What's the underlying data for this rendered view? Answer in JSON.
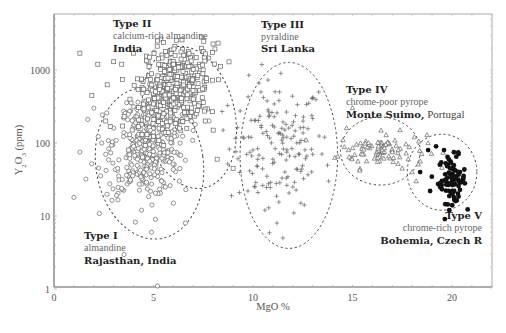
{
  "chart_data": {
    "type": "scatter",
    "title": "",
    "xlabel": "MgO %",
    "ylabel": "Y2O3 (ppm)",
    "ylabel_parts": {
      "base": "Y",
      "sub1": "2",
      "mid": "O",
      "sub2": "3",
      "rest": " (ppm)"
    },
    "xlim": [
      0,
      22
    ],
    "ylim": [
      1,
      5800
    ],
    "yscale": "log",
    "grid": false,
    "x_ticks": [
      0,
      5,
      10,
      15,
      20
    ],
    "x_tick_labels": [
      "0",
      "5",
      "10",
      "15",
      "20"
    ],
    "y_ticks": [
      1,
      10,
      100,
      1000
    ],
    "y_tick_labels": [
      "1",
      "10",
      "100",
      "1000"
    ],
    "series": [
      {
        "name": "Type I",
        "marker": "circle-open",
        "mineral": "almandine",
        "location": "Rajasthan, India",
        "cluster": {
          "x_center": 4.8,
          "x_spread": 0.9,
          "logy_center": 2.0,
          "logy_spread": 0.38,
          "count": 420
        },
        "points": [
          [
            1.0,
            18
          ],
          [
            1.3,
            75
          ],
          [
            1.6,
            32
          ],
          [
            1.7,
            210
          ],
          [
            1.9,
            52
          ],
          [
            2.0,
            300
          ],
          [
            2.4,
            100
          ],
          [
            2.6,
            70
          ],
          [
            3.0,
            160
          ],
          [
            3.2,
            45
          ],
          [
            3.5,
            220
          ],
          [
            3.8,
            130
          ],
          [
            4.0,
            90
          ],
          [
            4.2,
            60
          ],
          [
            4.4,
            180
          ],
          [
            4.6,
            110
          ],
          [
            4.8,
            70
          ],
          [
            5.0,
            140
          ],
          [
            5.2,
            40
          ],
          [
            5.4,
            95
          ],
          [
            5.6,
            25
          ],
          [
            5.8,
            55
          ],
          [
            6.0,
            15
          ],
          [
            6.3,
            30
          ],
          [
            6.6,
            8
          ],
          [
            5.2,
            1.1
          ],
          [
            4.9,
            6
          ],
          [
            5.1,
            9
          ]
        ]
      },
      {
        "name": "Type II",
        "marker": "square-open",
        "mineral": "calcium-rich almandine",
        "location": "India",
        "cluster": {
          "x_center": 6.0,
          "x_spread": 0.9,
          "logy_center": 2.75,
          "logy_spread": 0.3,
          "count": 380
        },
        "points": [
          [
            1.3,
            1700
          ],
          [
            1.9,
            450
          ],
          [
            2.2,
            1200
          ],
          [
            2.6,
            200
          ],
          [
            3.0,
            1300
          ],
          [
            3.4,
            1200
          ],
          [
            4.0,
            1700
          ],
          [
            4.8,
            1500
          ],
          [
            5.2,
            2500
          ],
          [
            5.6,
            1800
          ],
          [
            6.0,
            1200
          ],
          [
            6.4,
            800
          ],
          [
            6.8,
            600
          ],
          [
            7.0,
            400
          ],
          [
            7.2,
            280
          ],
          [
            7.6,
            200
          ],
          [
            8.0,
            150
          ],
          [
            8.2,
            60
          ],
          [
            9.0,
            45
          ]
        ]
      },
      {
        "name": "Type III",
        "marker": "plus",
        "mineral": "pyraldine",
        "location": "Sri Lanka",
        "cluster": {
          "x_center": 11.2,
          "x_spread": 1.2,
          "logy_center": 1.95,
          "logy_spread": 0.45,
          "count": 150
        },
        "points": [
          [
            7.6,
            200
          ],
          [
            8.5,
            150
          ],
          [
            9.5,
            120
          ],
          [
            10.0,
            80
          ],
          [
            10.4,
            500
          ],
          [
            10.8,
            230
          ],
          [
            11.0,
            60
          ],
          [
            11.4,
            900
          ],
          [
            11.6,
            40
          ],
          [
            11.8,
            160
          ],
          [
            12.0,
            25
          ],
          [
            12.2,
            100
          ],
          [
            12.4,
            15
          ],
          [
            12.8,
            350
          ],
          [
            13.0,
            70
          ],
          [
            13.3,
            500
          ],
          [
            13.6,
            120
          ],
          [
            13.8,
            30
          ],
          [
            11.5,
            5
          ],
          [
            11.2,
            8
          ],
          [
            10.6,
            12
          ]
        ]
      },
      {
        "name": "Type IV",
        "marker": "triangle-open",
        "mineral": "chrome-poor pyrope",
        "location": "Monte Suimo, Portugal",
        "cluster": {
          "x_center": 16.5,
          "x_spread": 1.1,
          "logy_center": 1.9,
          "logy_spread": 0.12,
          "count": 90
        },
        "points": [
          [
            14.8,
            80
          ],
          [
            15.2,
            95
          ],
          [
            15.5,
            70
          ],
          [
            15.8,
            100
          ],
          [
            16.3,
            90
          ],
          [
            16.6,
            85
          ],
          [
            17.0,
            75
          ],
          [
            17.3,
            80
          ],
          [
            17.8,
            60
          ],
          [
            18.0,
            40
          ],
          [
            18.2,
            30
          ],
          [
            15.0,
            300
          ],
          [
            14.7,
            160
          ]
        ]
      },
      {
        "name": "Type V",
        "marker": "circle-filled",
        "mineral": "chrome-rich pyrope",
        "location": "Bohemia, Czech R",
        "cluster": {
          "x_center": 20.0,
          "x_spread": 0.35,
          "logy_center": 1.5,
          "logy_spread": 0.16,
          "count": 75
        },
        "points": [
          [
            18.4,
            40
          ],
          [
            18.8,
            80
          ],
          [
            19.2,
            90
          ],
          [
            19.6,
            80
          ],
          [
            19.8,
            50
          ],
          [
            20.0,
            30
          ],
          [
            20.2,
            35
          ],
          [
            20.4,
            40
          ],
          [
            19.4,
            25
          ],
          [
            18.9,
            22
          ],
          [
            20.1,
            18
          ]
        ]
      }
    ],
    "annotations": [
      {
        "series": "Type I",
        "type_label": "Type I",
        "mineral": "almandine",
        "location_bold": "Rajasthan, India",
        "location_rest": ""
      },
      {
        "series": "Type II",
        "type_label": "Type II",
        "mineral": "calcium-rich almandine",
        "location_bold": "India",
        "location_rest": ""
      },
      {
        "series": "Type III",
        "type_label": "Type III",
        "mineral": "pyraldine",
        "location_bold": "Sri Lanka",
        "location_rest": ""
      },
      {
        "series": "Type IV",
        "type_label": "Type IV",
        "mineral": "chrome-poor pyrope",
        "location_bold": "Monte Suimo,",
        "location_rest": " Portugal"
      },
      {
        "series": "Type V",
        "type_label": "Type V",
        "mineral": "chrome-rich pyrope",
        "location_bold": "Bohemia, Czech R",
        "location_rest": ""
      }
    ],
    "ellipses": [
      {
        "series": "Type I",
        "cx": 4.8,
        "cy_log": 1.72,
        "rx": 2.7,
        "ry_px": 76,
        "rotate": -8
      },
      {
        "series": "Type II",
        "cx": 6.8,
        "cy_log": 2.35,
        "rx": 2.3,
        "ry_px": 72,
        "rotate": -12
      },
      {
        "series": "Type III",
        "cx": 11.8,
        "cy_log": 1.83,
        "rx": 2.45,
        "ry_px": 93,
        "rotate": 0
      },
      {
        "series": "Type IV",
        "cx": 16.4,
        "cy_log": 1.89,
        "rx": 2.0,
        "ry_px": 34,
        "rotate": 0
      },
      {
        "series": "Type V",
        "cx": 19.5,
        "cy_log": 1.6,
        "rx": 1.75,
        "ry_px": 38,
        "rotate": 0
      }
    ]
  },
  "colors": {
    "axis": "#888888",
    "marker": "#666666",
    "filled": "#111111",
    "ellipse": "#444444"
  }
}
